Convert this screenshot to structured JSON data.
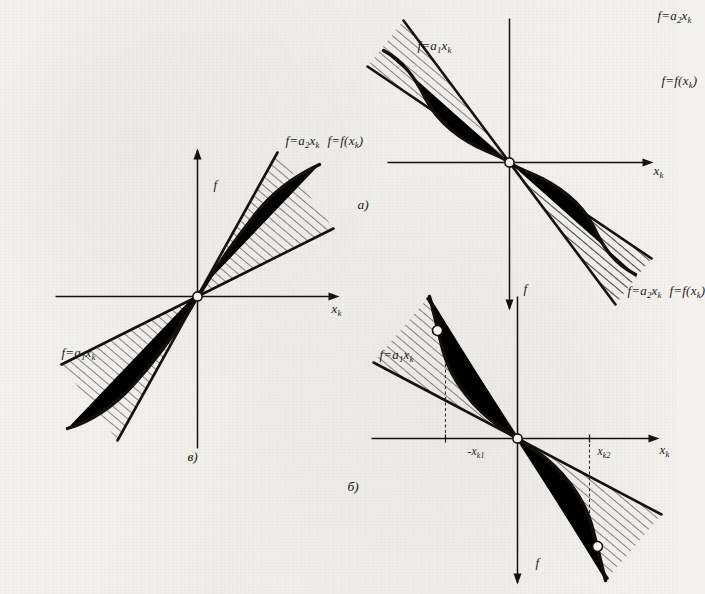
{
  "figure": {
    "kind": "sector-nonlinearity-diagrams",
    "ink_color": "#16120f",
    "paper_color": "#f3f2ef",
    "rotation_degrees": 90
  },
  "panels": [
    {
      "tag": "a)",
      "axes": {
        "vertical": "f",
        "horizontal": "x",
        "horizontal_sub": "k"
      },
      "labels": [
        {
          "name": "upper-bound-line",
          "text": "f=a",
          "sub": "2",
          "tail": "x",
          "tail_sub": "k",
          "full": "f=a2xk"
        },
        {
          "name": "characteristic-curve",
          "text": "f=f(x",
          "sub": "k",
          "tail": ")",
          "full": "f=f(xk)"
        },
        {
          "name": "lower-bound-line",
          "text": "f=a",
          "sub": "1",
          "tail": "x",
          "tail_sub": "k",
          "full": "f=a1xk"
        }
      ]
    },
    {
      "tag": "б)",
      "axes": {
        "vertical": "f",
        "horizontal": "x",
        "horizontal_sub": "k"
      },
      "ticks": [
        {
          "name": "tick-positive",
          "text": "x",
          "sub": "k2",
          "full": "xk2"
        },
        {
          "name": "tick-negative",
          "text": "-x",
          "sub": "k1",
          "full": "-xk1"
        }
      ],
      "labels": [
        {
          "name": "upper-bound-line",
          "text": "f=a",
          "sub": "2",
          "tail": "x",
          "tail_sub": "k",
          "full": "f=a2xk"
        },
        {
          "name": "characteristic-curve",
          "text": "f=f(x",
          "sub": "k",
          "tail": ")",
          "full": "f=f(xk)"
        },
        {
          "name": "lower-bound-line",
          "text": "f=a",
          "sub": "1",
          "tail": "x",
          "tail_sub": "k",
          "full": "f=a1xk"
        }
      ]
    },
    {
      "tag": "в)",
      "axes": {
        "vertical": "f",
        "horizontal": "x",
        "horizontal_sub": "k"
      },
      "labels": [
        {
          "name": "upper-bound-line",
          "text": "f=a",
          "sub": "2",
          "tail": "x",
          "tail_sub": "k",
          "full": "f=a2xk"
        },
        {
          "name": "characteristic-curve",
          "text": "f=f(x",
          "sub": "k",
          "tail": ")",
          "full": "f=f(xk)"
        },
        {
          "name": "lower-bound-line",
          "text": "f=a",
          "sub": "1",
          "tail": "x",
          "tail_sub": "k",
          "full": "f=a1xk"
        }
      ]
    }
  ],
  "text": {
    "axis_f": "f",
    "axis_x": "x",
    "axis_x_sub": "k",
    "lbl_a2": "f=a",
    "sub_2": "2",
    "lbl_a1": "f=a",
    "sub_1": "1",
    "xk": "x",
    "sub_k": "k",
    "lbl_fx_head": "f=f(",
    "lbl_fx_tail": ")",
    "tick_pos_head": "x",
    "tick_pos_sub": "k2",
    "tick_neg_head": "-x",
    "tick_neg_sub": "k1",
    "tag_a": "a)",
    "tag_b": "б)",
    "tag_v": "в)"
  }
}
